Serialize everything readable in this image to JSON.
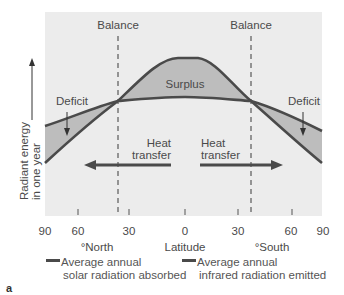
{
  "figure": {
    "letter": "a",
    "y_axis_label_line1": "Radiant energy",
    "y_axis_label_line2": "in one year",
    "x_axis_label": "Latitude",
    "x_north_label": "°North",
    "x_south_label": "°South",
    "x_tick_labels": [
      "90",
      "60",
      "30",
      "0",
      "30",
      "60",
      "90"
    ],
    "balance_left": "Balance",
    "balance_right": "Balance",
    "surplus": "Surplus",
    "deficit_left": "Deficit",
    "deficit_right": "Deficit",
    "heat_left_line1": "Heat",
    "heat_left_line2": "transfer",
    "heat_right_line1": "Heat",
    "heat_right_line2": "transfer"
  },
  "legend": {
    "solar_line1": "Average annual",
    "solar_line2": "solar radiation absorbed",
    "ir_line1": "Average annual",
    "ir_line2": "infrared radiation emitted"
  },
  "colors": {
    "plot_bg": "#ececec",
    "shade": "#bdbdbd",
    "curve": "#4a4a4a"
  }
}
